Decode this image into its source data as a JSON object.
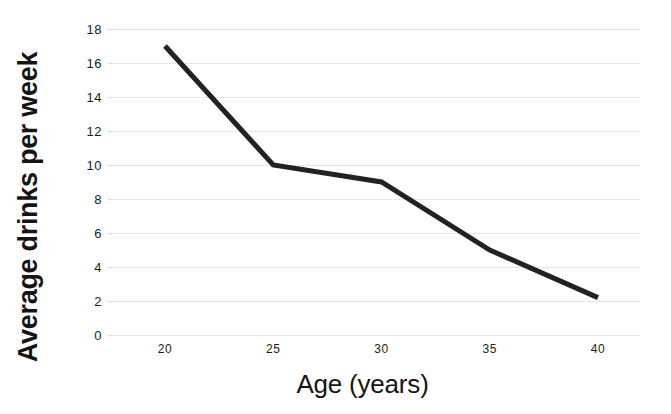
{
  "chart_data": {
    "type": "line",
    "title": "",
    "xlabel": "Age (years)",
    "ylabel": "Average drinks per week",
    "x": [
      20,
      25,
      30,
      35,
      40
    ],
    "values": [
      17,
      10,
      9,
      5,
      2.2
    ],
    "series": [
      {
        "name": "Average drinks per week",
        "values": [
          17,
          10,
          9,
          5,
          2.2
        ]
      }
    ],
    "categories": [
      "20",
      "25",
      "30",
      "35",
      "40"
    ],
    "xlim": [
      17.5,
      42.5
    ],
    "ylim": [
      0,
      18
    ],
    "x_ticks": [
      20,
      25,
      30,
      35,
      40
    ],
    "x_tick_labels": [
      "20",
      "25",
      "30",
      "35",
      "40"
    ],
    "y_ticks": [
      0,
      2,
      4,
      6,
      8,
      10,
      12,
      14,
      16,
      18
    ],
    "y_tick_labels": [
      "0",
      "2",
      "4",
      "6",
      "8",
      "10",
      "12",
      "14",
      "16",
      "18"
    ],
    "grid": "horizontal-dotted",
    "legend": "none",
    "line_color": "#222222",
    "line_width": 5,
    "markers": "none",
    "grid_color": "#d2d2d2",
    "background_color": "#ffffff"
  },
  "axes": {
    "y_title": "Average drinks per week",
    "x_title": "Age (years)"
  }
}
